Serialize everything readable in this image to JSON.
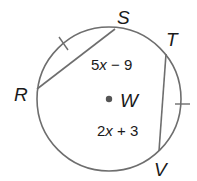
{
  "diagram": {
    "center": {
      "label": "W"
    },
    "points": [
      {
        "label": "S"
      },
      {
        "label": "T"
      },
      {
        "label": "R"
      },
      {
        "label": "V"
      }
    ],
    "chords": [
      {
        "name": "RS",
        "length_expr": {
          "coef": "5",
          "var": "x",
          "rest": " − 9"
        }
      },
      {
        "name": "TV",
        "length_expr": {
          "coef": "2",
          "var": "x",
          "rest": " + 3"
        }
      }
    ],
    "colors": {
      "stroke": "#6e6e6e",
      "text": "#1a1a1a",
      "dot": "#555555"
    }
  }
}
